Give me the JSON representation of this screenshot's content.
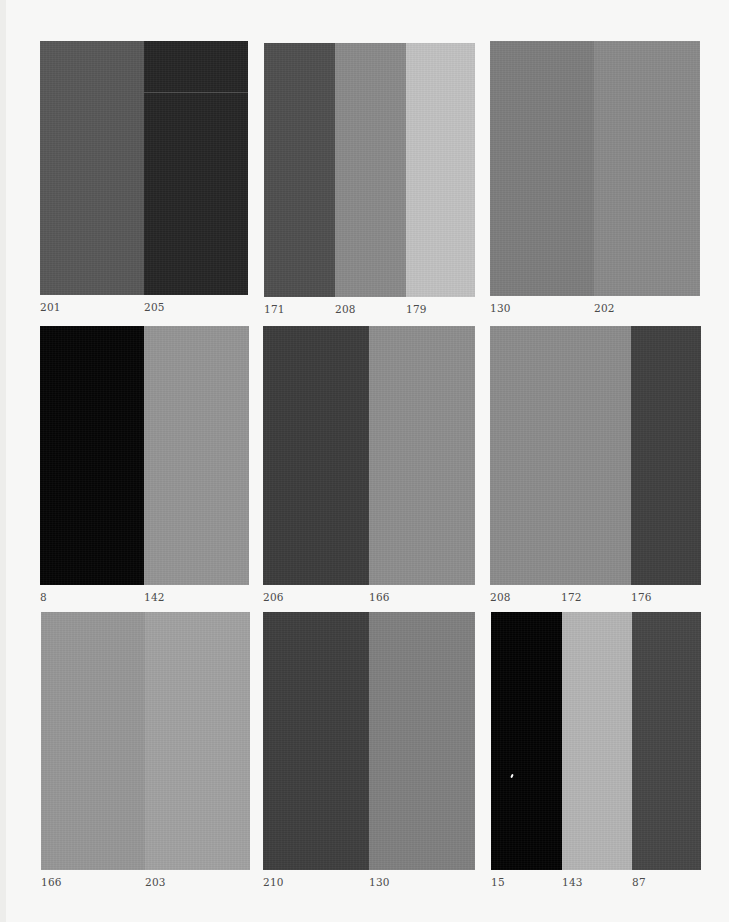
{
  "page": {
    "background": "#f7f7f6",
    "label_color": "#4a4a4a"
  },
  "swatches": [
    {
      "id": "r1c1",
      "box": {
        "x": 40,
        "y": 41,
        "w": 208,
        "h": 254
      },
      "stripes": [
        {
          "label": "201",
          "color": "#585858",
          "width": 104
        },
        {
          "label": "205",
          "color": "#262626",
          "width": 104,
          "flaw_y": 51
        }
      ]
    },
    {
      "id": "r1c2",
      "box": {
        "x": 264,
        "y": 43,
        "w": 211,
        "h": 254
      },
      "stripes": [
        {
          "label": "171",
          "color": "#4f4f4f",
          "width": 71
        },
        {
          "label": "208",
          "color": "#8a8a8a",
          "width": 71
        },
        {
          "label": "179",
          "color": "#c2c2c2",
          "width": 69
        }
      ]
    },
    {
      "id": "r1c3",
      "box": {
        "x": 490,
        "y": 41,
        "w": 210,
        "h": 255
      },
      "stripes": [
        {
          "label": "130",
          "color": "#7d7d7d",
          "width": 104
        },
        {
          "label": "202",
          "color": "#8a8a8a",
          "width": 106
        }
      ]
    },
    {
      "id": "r2c1",
      "box": {
        "x": 40,
        "y": 326,
        "w": 209,
        "h": 259
      },
      "stripes": [
        {
          "label": "8",
          "color": "#050505",
          "width": 104
        },
        {
          "label": "142",
          "color": "#959595",
          "width": 105
        }
      ]
    },
    {
      "id": "r2c2",
      "box": {
        "x": 263,
        "y": 326,
        "w": 212,
        "h": 259
      },
      "stripes": [
        {
          "label": "206",
          "color": "#3c3c3c",
          "width": 106
        },
        {
          "label": "166",
          "color": "#8e8e8e",
          "width": 106
        }
      ]
    },
    {
      "id": "r2c3",
      "box": {
        "x": 490,
        "y": 326,
        "w": 211,
        "h": 259
      },
      "stripes": [
        {
          "label": "208",
          "color": "#8c8c8c",
          "width": 71
        },
        {
          "label": "172",
          "color": "#8c8c8c",
          "width": 70
        },
        {
          "label": "176",
          "color": "#404040",
          "width": 70
        }
      ]
    },
    {
      "id": "r3c1",
      "box": {
        "x": 41,
        "y": 612,
        "w": 209,
        "h": 258
      },
      "stripes": [
        {
          "label": "166",
          "color": "#979797",
          "width": 104
        },
        {
          "label": "203",
          "color": "#a2a2a2",
          "width": 105
        }
      ]
    },
    {
      "id": "r3c2",
      "box": {
        "x": 263,
        "y": 612,
        "w": 212,
        "h": 258
      },
      "stripes": [
        {
          "label": "210",
          "color": "#3e3e3e",
          "width": 106
        },
        {
          "label": "130",
          "color": "#808080",
          "width": 106
        }
      ]
    },
    {
      "id": "r3c3",
      "box": {
        "x": 491,
        "y": 612,
        "w": 210,
        "h": 258
      },
      "stripes": [
        {
          "label": "15",
          "color": "#030303",
          "width": 71,
          "speck": {
            "x": 20,
            "y": 162
          }
        },
        {
          "label": "143",
          "color": "#b5b5b5",
          "width": 70
        },
        {
          "label": "87",
          "color": "#464646",
          "width": 69
        }
      ]
    }
  ]
}
